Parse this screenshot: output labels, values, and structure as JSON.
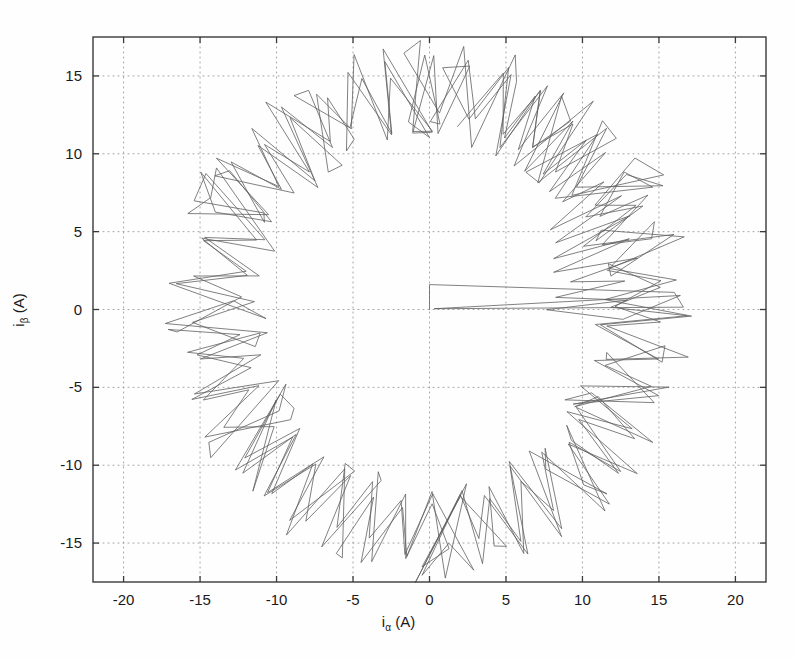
{
  "figure": {
    "background": "#fefefe",
    "plot_box": {
      "left": 93,
      "top": 37,
      "right": 766,
      "bottom": 582
    },
    "axis_color": "#3a3a3a",
    "grid_color": "#9a9a9a",
    "trace_color": "#5d5d5d",
    "tick_label_color": "#1a1a1a"
  },
  "labels": {
    "xlabel_main": "i",
    "xlabel_sub": "α",
    "xlabel_unit": " (A)",
    "ylabel_main": "i",
    "ylabel_sub": "β",
    "ylabel_unit": " (A)"
  },
  "chart_data": {
    "type": "line",
    "title": "",
    "xlabel": "i_alpha (A)",
    "ylabel": "i_beta (A)",
    "xlim": [
      -22.0,
      22.0
    ],
    "ylim": [
      -17.5,
      17.5
    ],
    "xticks": [
      -20,
      -15,
      -10,
      -5,
      0,
      5,
      10,
      15,
      20
    ],
    "xticklabels": [
      "-20",
      "-15",
      "-10",
      "-5",
      "0",
      "5",
      "10",
      "15",
      "20"
    ],
    "yticks": [
      -15,
      -10,
      -5,
      0,
      5,
      10,
      15
    ],
    "yticklabels": [
      "-15",
      "-10",
      "-5",
      "0",
      "5",
      "10",
      "15"
    ],
    "grid": true,
    "grid_style": "dotted",
    "legend": null,
    "series": [
      {
        "name": "stator current vector trajectory (hysteresis band control)",
        "description": "Zigzag switching ripple of a current-controlled inverter traced in the alpha-beta stationary reference frame; the trajectory forms a thick annular band around a circular reference of radius ~14 A with a hysteresis ripple band of roughly +/-3 A, plus an initial startup wedge from the origin.",
        "reference_radius": 14.0,
        "ripple_band_half_width": 3.0,
        "ripple_cycles_per_revolution": 78,
        "revolutions": 3,
        "startup_wedge": {
          "origin": [
            0.0,
            0.0
          ],
          "vertical_tip": [
            0.0,
            1.6
          ],
          "upper_end": [
            16.0,
            1.1
          ],
          "lower_end": [
            16.6,
            0.15
          ]
        },
        "measured_extent": {
          "x_min": -17.6,
          "x_max": 17.6,
          "y_min": -16.9,
          "y_max": 16.9
        }
      }
    ]
  }
}
